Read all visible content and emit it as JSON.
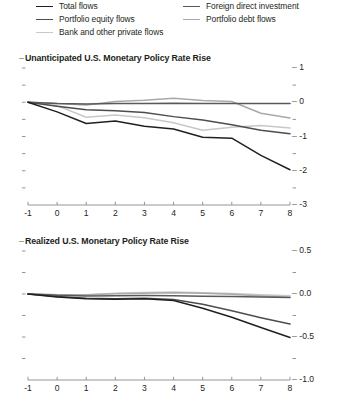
{
  "legend": {
    "items": [
      {
        "label": "Total flows",
        "color": "#231f20",
        "column": "left"
      },
      {
        "label": "Portfolio equity flows",
        "color": "#4d4d4f",
        "column": "left"
      },
      {
        "label": "Bank and other private flows",
        "color": "#c7c8ca",
        "column": "left"
      },
      {
        "label": "Foreign direct investment",
        "color": "#58595b",
        "column": "right"
      },
      {
        "label": "Portfolio debt flows",
        "color": "#a7a9ac",
        "column": "right"
      }
    ]
  },
  "panels": [
    {
      "id": "top",
      "title": "Unanticipated U.S. Monetary Policy Rate Rise",
      "y_major": [
        "1",
        "0",
        "-1",
        "-2",
        "-3"
      ],
      "x_ticks": [
        "-1",
        "0",
        "1",
        "2",
        "3",
        "4",
        "5",
        "6",
        "7",
        "8"
      ]
    },
    {
      "id": "bottom",
      "title": "Realized U.S. Monetary Policy Rate Rise",
      "y_major": [
        "0.5",
        "0.0",
        "-0.5",
        "-1.0"
      ],
      "x_ticks": [
        "-1",
        "0",
        "1",
        "2",
        "3",
        "4",
        "5",
        "6",
        "7",
        "8"
      ]
    }
  ],
  "chart_data": [
    {
      "type": "line",
      "title": "Unanticipated U.S. Monetary Policy Rate Rise",
      "xlabel": "",
      "ylabel": "",
      "x": [
        -1,
        0,
        1,
        2,
        3,
        4,
        5,
        6,
        7,
        8
      ],
      "xlim": [
        -1,
        8
      ],
      "ylim": [
        -3,
        1
      ],
      "yticks": [
        1,
        0,
        -1,
        -2,
        -3
      ],
      "minor_yticks": [
        0.5,
        -0.5,
        -1.5,
        -2.5
      ],
      "grid": false,
      "legend_position": "above-figure",
      "series": [
        {
          "name": "Total flows",
          "color": "#231f20",
          "values": [
            0.0,
            -0.28,
            -0.62,
            -0.55,
            -0.7,
            -0.78,
            -1.02,
            -1.05,
            -1.55,
            -1.97
          ]
        },
        {
          "name": "Portfolio equity flows",
          "color": "#4d4d4f",
          "values": [
            0.0,
            -0.12,
            -0.22,
            -0.25,
            -0.3,
            -0.42,
            -0.52,
            -0.66,
            -0.82,
            -0.92
          ]
        },
        {
          "name": "Bank and other private flows",
          "color": "#c7c8ca",
          "values": [
            0.0,
            -0.1,
            -0.44,
            -0.37,
            -0.45,
            -0.6,
            -0.82,
            -0.73,
            -0.68,
            -0.75
          ]
        },
        {
          "name": "Foreign direct investment",
          "color": "#58595b",
          "values": [
            0.0,
            -0.04,
            -0.05,
            -0.04,
            -0.04,
            -0.03,
            -0.04,
            -0.04,
            -0.04,
            -0.04
          ]
        },
        {
          "name": "Portfolio debt flows",
          "color": "#a7a9ac",
          "values": [
            0.0,
            -0.04,
            -0.08,
            0.02,
            0.06,
            0.12,
            0.05,
            0.02,
            -0.32,
            -0.46
          ]
        }
      ]
    },
    {
      "type": "line",
      "title": "Realized U.S. Monetary Policy Rate Rise",
      "xlabel": "",
      "ylabel": "",
      "x": [
        -1,
        0,
        1,
        2,
        3,
        4,
        5,
        6,
        7,
        8
      ],
      "xlim": [
        -1,
        8
      ],
      "ylim": [
        -1.0,
        0.5
      ],
      "yticks": [
        0.5,
        0.0,
        -0.5,
        -1.0
      ],
      "minor_yticks": [
        0.25,
        -0.25,
        -0.75
      ],
      "grid": false,
      "legend_position": "above-figure",
      "series": [
        {
          "name": "Total flows",
          "color": "#231f20",
          "values": [
            0.0,
            -0.035,
            -0.055,
            -0.06,
            -0.055,
            -0.075,
            -0.165,
            -0.27,
            -0.39,
            -0.505
          ]
        },
        {
          "name": "Portfolio equity flows",
          "color": "#4d4d4f",
          "values": [
            0.0,
            -0.03,
            -0.05,
            -0.055,
            -0.05,
            -0.065,
            -0.12,
            -0.195,
            -0.275,
            -0.35
          ]
        },
        {
          "name": "Bank and other private flows",
          "color": "#c7c8ca",
          "values": [
            0.0,
            -0.01,
            -0.012,
            0.01,
            0.018,
            0.022,
            0.014,
            0.005,
            -0.01,
            -0.02
          ]
        },
        {
          "name": "Foreign direct investment",
          "color": "#58595b",
          "values": [
            0.0,
            -0.015,
            -0.022,
            -0.02,
            -0.018,
            -0.02,
            -0.026,
            -0.03,
            -0.036,
            -0.042
          ]
        },
        {
          "name": "Portfolio debt flows",
          "color": "#a7a9ac",
          "values": [
            0.0,
            -0.008,
            -0.01,
            0.004,
            0.01,
            0.014,
            0.008,
            -0.004,
            -0.024,
            -0.038
          ]
        }
      ]
    }
  ]
}
